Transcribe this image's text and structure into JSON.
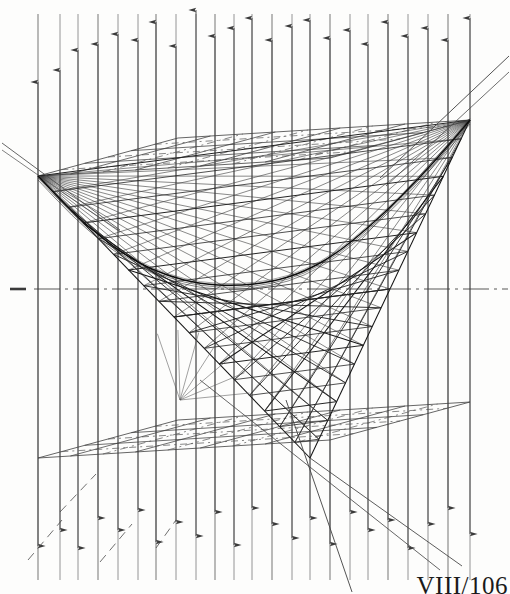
{
  "figure": {
    "caption": "VIII/106",
    "background_color": "#fdfdfc",
    "ink_color": "#1a1a1a",
    "light_ink_color": "#6a6a6a"
  },
  "chart_data": {
    "type": "line",
    "xlabel": "",
    "ylabel": "",
    "grid": true,
    "legend": null,
    "xlim": [
      0,
      510
    ],
    "ylim": [
      0,
      594
    ],
    "annotations": [
      "VIII/106"
    ],
    "vertices": {
      "left_vertex": [
        38,
        176
      ],
      "right_vertex": [
        470,
        120
      ],
      "bottom_vertex": [
        310,
        458
      ]
    },
    "axis_line_y": 289,
    "axis_tick_x": [
      10,
      26
    ],
    "top_plane_corners": [
      [
        38,
        176
      ],
      [
        178,
        138
      ],
      [
        470,
        120
      ],
      [
        330,
        158
      ]
    ],
    "bottom_plane_corners": [
      [
        38,
        458
      ],
      [
        178,
        420
      ],
      [
        470,
        402
      ],
      [
        330,
        440
      ]
    ],
    "vertical_lines_x": [
      38,
      60,
      78,
      98,
      118,
      138,
      156,
      176,
      196,
      215,
      234,
      252,
      272,
      292,
      310,
      330,
      350,
      368,
      388,
      408,
      428,
      448,
      470
    ],
    "up_arrow_tops": [
      82,
      70,
      50,
      44,
      34,
      40,
      22,
      46,
      10,
      36,
      28,
      18,
      40,
      26,
      20,
      38,
      30,
      44,
      22,
      36,
      28,
      40,
      18
    ],
    "down_arrow_bottoms": [
      546,
      530,
      548,
      518,
      530,
      510,
      542,
      522,
      536,
      512,
      545,
      508,
      524,
      538,
      518,
      544,
      512,
      530,
      520,
      548,
      524,
      508,
      534
    ],
    "ruled_lines_count": 18,
    "parabola_apex": [
      236,
      286
    ],
    "series": [
      {
        "name": "upper-envelope-curve",
        "points": [
          [
            38,
            176
          ],
          [
            72,
            212
          ],
          [
            104,
            240
          ],
          [
            136,
            262
          ],
          [
            168,
            276
          ],
          [
            200,
            284
          ],
          [
            236,
            286
          ],
          [
            272,
            282
          ],
          [
            304,
            272
          ],
          [
            336,
            254
          ],
          [
            368,
            228
          ],
          [
            402,
            196
          ],
          [
            436,
            160
          ],
          [
            470,
            120
          ]
        ]
      },
      {
        "name": "lower-left-ruling-fan-origin",
        "points": [
          [
            38,
            176
          ],
          [
            310,
            458
          ]
        ]
      },
      {
        "name": "lower-right-ruling-fan-origin",
        "points": [
          [
            310,
            458
          ],
          [
            470,
            120
          ]
        ]
      }
    ]
  }
}
